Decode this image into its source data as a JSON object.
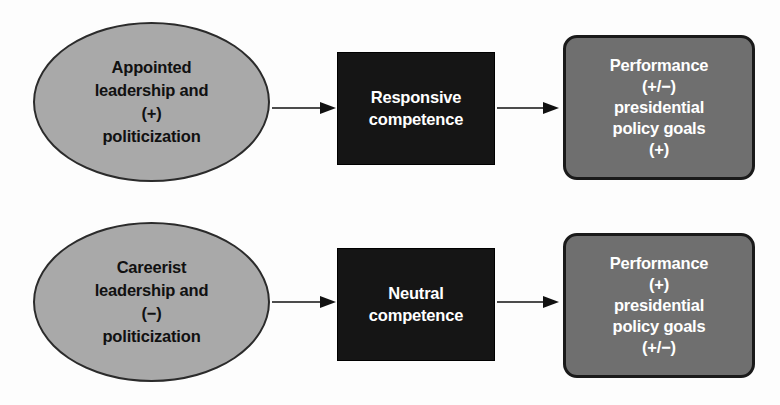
{
  "diagram": {
    "type": "flow",
    "rows": [
      {
        "id": "row-appointed",
        "source": {
          "shape": "ellipse",
          "lines": [
            "Appointed",
            "leadership and",
            "(+)",
            "politicization"
          ]
        },
        "mediator": {
          "shape": "rectangle",
          "lines": [
            "Responsive",
            "competence"
          ]
        },
        "outcome": {
          "shape": "rounded-rectangle",
          "lines": [
            "Performance",
            "(+/−)",
            "presidential",
            "policy goals",
            "(+)"
          ]
        },
        "arrows": [
          "arrow-right",
          "arrow-right"
        ]
      },
      {
        "id": "row-careerist",
        "source": {
          "shape": "ellipse",
          "lines": [
            "Careerist",
            "leadership and",
            "(−)",
            "politicization"
          ]
        },
        "mediator": {
          "shape": "rectangle",
          "lines": [
            "Neutral",
            "competence"
          ]
        },
        "outcome": {
          "shape": "rounded-rectangle",
          "lines": [
            "Performance",
            "(+)",
            "presidential",
            "policy goals",
            "(+/−)"
          ]
        },
        "arrows": [
          "arrow-right",
          "arrow-right"
        ]
      }
    ],
    "colors": {
      "ellipse_fill": "#a9a9a9",
      "ellipse_stroke": "#2b2b2b",
      "blackbox_fill": "#151515",
      "blackbox_text": "#ffffff",
      "roundbox_fill": "#6f6f6f",
      "roundbox_stroke": "#1a1a1a",
      "roundbox_text": "#ffffff",
      "arrow": "#111111",
      "background": "#fdfdfd"
    }
  }
}
